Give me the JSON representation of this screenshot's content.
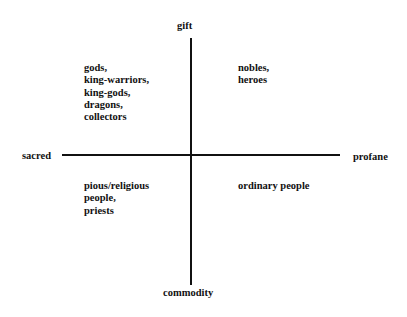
{
  "axes": {
    "top": "gift",
    "bottom": "commodity",
    "left": "sacred",
    "right": "profane"
  },
  "quadrants": {
    "top_left": [
      "gods,",
      "king-warriors,",
      "king-gods,",
      "dragons,",
      "collectors"
    ],
    "top_right": [
      "nobles,",
      "heroes"
    ],
    "bottom_left": [
      "pious/religious",
      "people,",
      "priests"
    ],
    "bottom_right": [
      "ordinary people"
    ]
  }
}
